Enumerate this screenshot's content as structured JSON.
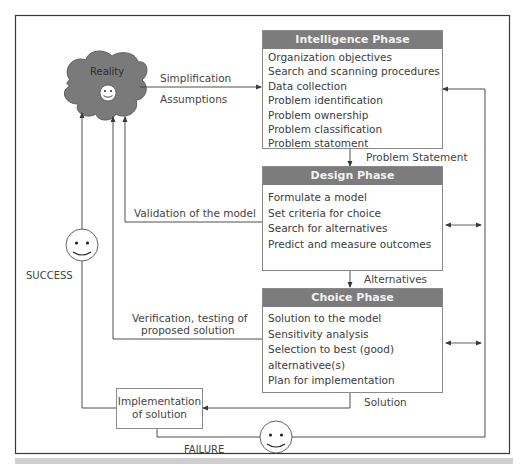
{
  "diagram": {
    "reality": {
      "label": "Reality"
    },
    "arrows_labels": {
      "simplification": "Simplification",
      "assumptions": "Assumptions",
      "problem_statement": "Problem Statement",
      "alternatives": "Alternatives",
      "solution": "Solution",
      "validation": "Validation of the model",
      "verification_line1": "Verification, testing of",
      "verification_line2": "proposed solution",
      "success": "SUCCESS",
      "failure": "FAILURE"
    },
    "phases": [
      {
        "name": "Intelligence Phase",
        "items": [
          "Organization objectives",
          "Search and scanning procedures",
          "Data collection",
          "Problem identification",
          "Problem ownership",
          "Problem classification",
          "Problem statoment"
        ]
      },
      {
        "name": "Design Phase",
        "items": [
          "Formulate a model",
          "Set criteria for choice",
          "Search for alternatives",
          "Predict and measure outcomes"
        ]
      },
      {
        "name": "Choice Phase",
        "items": [
          "Solution to the model",
          "Sensitivity analysis",
          "Selection to best (good)",
          "alternativee(s)",
          "Plan for implementation"
        ]
      }
    ],
    "implementation": {
      "line1": "Implementation",
      "line2": "of solution"
    },
    "colors": {
      "header_fill": "#7c7c7c",
      "cloud_fill": "#7a7a7a",
      "line": "#4a4a4a",
      "box_border": "#8a8a8a"
    }
  }
}
